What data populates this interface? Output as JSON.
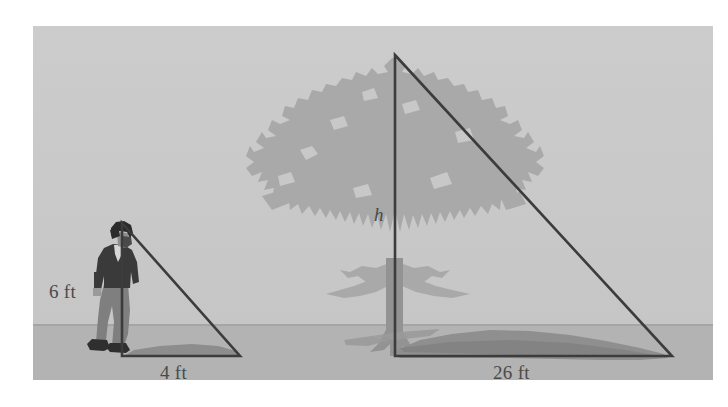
{
  "figure": {
    "labels": {
      "person_height": "6 ft",
      "person_shadow": "4 ft",
      "tree_shadow": "26 ft",
      "tree_height_variable": "h"
    },
    "colors": {
      "sky": "#c8c8c8",
      "ground": "#b2b2b2",
      "tree_foliage": "#a8a8a8",
      "tree_trunk": "#8f8f8f",
      "shadow": "#909090",
      "triangle_stroke": "#3c3c3c",
      "person_dark": "#3a3a3a",
      "person_pants": "#7d7d7d",
      "label_text": "#4a4a4a",
      "page_background": "#ffffff"
    },
    "scene": {
      "horizon_y": 325,
      "ground_baseline_y": 356,
      "frame": {
        "x": 33,
        "y": 26,
        "width": 680,
        "height": 354
      }
    },
    "triangles": [
      {
        "name": "person-triangle",
        "apex": [
          122,
          223
        ],
        "base_left": [
          122,
          356
        ],
        "base_right": [
          240,
          356
        ],
        "vertical_label": "6 ft",
        "horizontal_label": "4 ft"
      },
      {
        "name": "tree-triangle",
        "apex": [
          395,
          55
        ],
        "base_left": [
          395,
          356
        ],
        "base_right": [
          672,
          356
        ],
        "vertical_label": "h",
        "horizontal_label": "26 ft"
      }
    ]
  }
}
